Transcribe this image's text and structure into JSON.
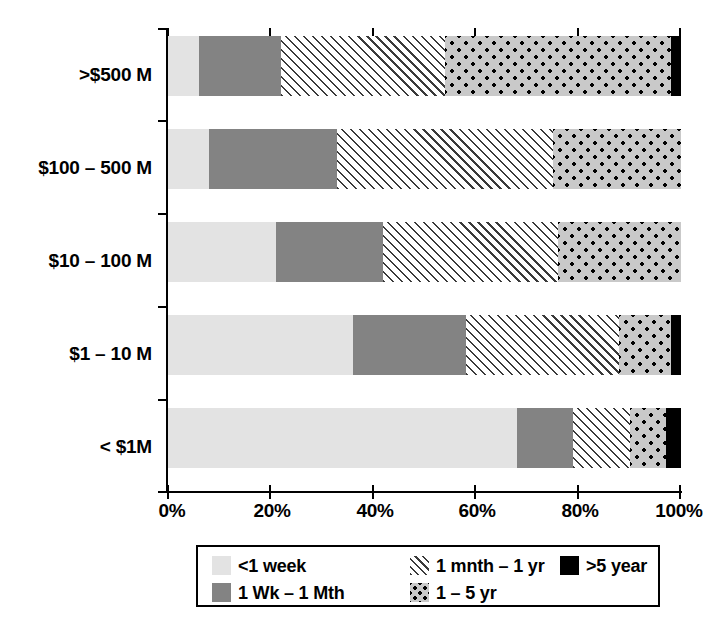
{
  "chart_data": {
    "type": "bar",
    "orientation": "horizontal",
    "stacked": true,
    "normalized_percent": true,
    "title": "",
    "xlabel": "",
    "ylabel": "",
    "xlim": [
      0,
      100
    ],
    "grid": false,
    "legend_position": "bottom",
    "categories": [
      "< $1M",
      "$1 – 10 M",
      "$10 – 100 M",
      "$100 – 500 M",
      ">$500 M"
    ],
    "categories_top_to_bottom": [
      ">$500 M",
      "$100 – 500 M",
      "$10 – 100 M",
      "$1 – 10 M",
      "< $1M"
    ],
    "series": [
      {
        "name": "<1 week",
        "pattern": "solid-light-gray",
        "color": "#e3e3e3",
        "values": [
          68,
          36,
          21,
          8,
          6
        ]
      },
      {
        "name": "1 Wk – 1 Mth",
        "pattern": "solid-dark-gray",
        "color": "#838383",
        "values": [
          11,
          22,
          21,
          25,
          16
        ]
      },
      {
        "name": "1 mnth – 1 yr",
        "pattern": "diagonal-hatch",
        "color": "#ffffff",
        "values": [
          11,
          30,
          34,
          42,
          32
        ]
      },
      {
        "name": "1 – 5 yr",
        "pattern": "dotted",
        "color": "#c9c9c9",
        "values": [
          7,
          10,
          24,
          25,
          44
        ]
      },
      {
        "name": ">5 year",
        "pattern": "solid-black",
        "color": "#000000",
        "values": [
          3,
          2,
          0,
          0,
          2
        ]
      }
    ],
    "xticks": [
      0,
      20,
      40,
      60,
      80,
      100
    ],
    "xtick_labels": [
      "0%",
      "20%",
      "40%",
      "60%",
      "80%",
      "100%"
    ]
  },
  "axis": {
    "x_tick_labels": [
      "0%",
      "20%",
      "40%",
      "60%",
      "80%",
      "100%"
    ],
    "y_tick_labels": [
      ">$500 M",
      "$100 – 500 M",
      "$10 – 100 M",
      "$1 – 10 M",
      "< $1M"
    ]
  },
  "legend": {
    "entries": [
      {
        "label": "<1 week",
        "pattern": "solid-light-gray"
      },
      {
        "label": "1 Wk – 1 Mth",
        "pattern": "solid-dark-gray"
      },
      {
        "label": "1 mnth – 1 yr",
        "pattern": "diagonal-hatch"
      },
      {
        "label": "1 – 5 yr",
        "pattern": "dotted"
      },
      {
        "label": ">5 year",
        "pattern": "solid-black"
      }
    ]
  },
  "colors": {
    "light_gray": "#e3e3e3",
    "dark_gray": "#838383",
    "dots_fill": "#c9c9c9",
    "black": "#000000",
    "hatch_line": "#3a3a3a",
    "background": "#ffffff"
  }
}
